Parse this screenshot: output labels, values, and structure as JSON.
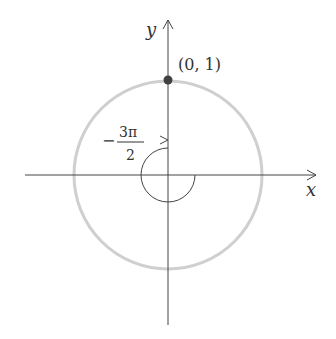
{
  "diagram": {
    "axes": {
      "x_label": "x",
      "y_label": "y"
    },
    "point": {
      "label": "(0, 1)",
      "coords": [
        0,
        1
      ]
    },
    "angle": {
      "sign": "−",
      "numerator": "3π",
      "denominator": "2",
      "value": "-3π/2",
      "direction": "clockwise"
    },
    "colors": {
      "axis": "#444444",
      "circle": "#cfcfcf",
      "point": "#404040",
      "arc": "#444444",
      "text": "#333333"
    }
  }
}
